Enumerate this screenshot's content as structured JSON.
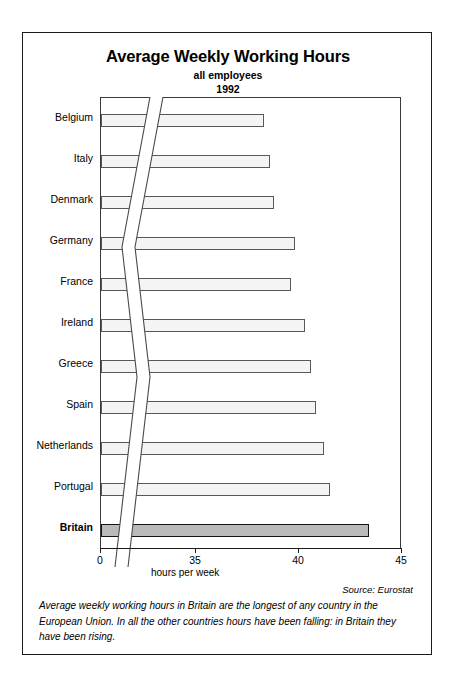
{
  "figure": {
    "title": "Average Weekly Working Hours",
    "subtitle": "all employees",
    "year": "1992",
    "source": "Source: Eurostat",
    "caption": "Average weekly working hours in Britain are the longest of any country in the European Union. In all the other countries hours have been falling: in Britain they have been rising."
  },
  "chart_data": {
    "type": "bar",
    "orientation": "horizontal",
    "title": "Average Weekly Working Hours",
    "subtitle": "all employees",
    "year": "1992",
    "xlabel": "hours per week",
    "ylabel": "",
    "xlim": [
      0,
      45
    ],
    "axis_break": {
      "present": true,
      "style": "zigzag",
      "between": [
        0,
        35
      ],
      "note": "x-axis compressed between 0 and 35"
    },
    "xticks": [
      0,
      35,
      40,
      45
    ],
    "xticklabels": [
      "0",
      "35",
      "40",
      "45"
    ],
    "grid": false,
    "legend": false,
    "highlight_category": "Britain",
    "highlight_color": "#b9b9b9",
    "bar_color": "#f4f4f4",
    "bar_edge_color": "#58585a",
    "categories": [
      "Belgium",
      "Italy",
      "Denmark",
      "Germany",
      "France",
      "Ireland",
      "Greece",
      "Spain",
      "Netherlands",
      "Portugal",
      "Britain"
    ],
    "values": [
      38.3,
      38.6,
      38.8,
      39.8,
      39.6,
      40.3,
      40.6,
      40.8,
      41.2,
      41.5,
      43.4
    ],
    "annotations": [
      "Source: Eurostat"
    ]
  }
}
